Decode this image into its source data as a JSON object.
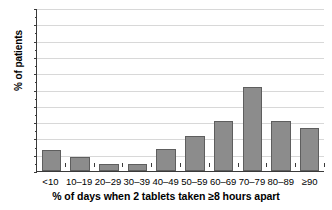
{
  "chart_data": {
    "type": "bar",
    "title": "",
    "xlabel": "% of days when 2 tablets taken ≥8 hours apart",
    "ylabel": "% of patients",
    "categories": [
      "<10",
      "10–19",
      "20–29",
      "30–39",
      "40–49",
      "50–59",
      "60–69",
      "70–79",
      "80–89",
      "≥90"
    ],
    "values": [
      6.3,
      4.4,
      2.0,
      2.0,
      6.6,
      10.7,
      15.2,
      25.9,
      15.3,
      13.1
    ],
    "ylim": [
      0,
      50
    ],
    "ytick_values": [
      0,
      5,
      10,
      15,
      20,
      25,
      30,
      35,
      40,
      45,
      50
    ],
    "ytick_labels": [
      "0",
      "5",
      "10",
      "15",
      "20",
      "25",
      "30",
      "35",
      "40",
      "45",
      "50"
    ],
    "grid": true,
    "legend": false,
    "bar_color": "#8c8c8c",
    "bar_border_color": "#5e5e5e",
    "gridline_color": "#d8d8d8",
    "axis_color": "#3a3a3a"
  }
}
